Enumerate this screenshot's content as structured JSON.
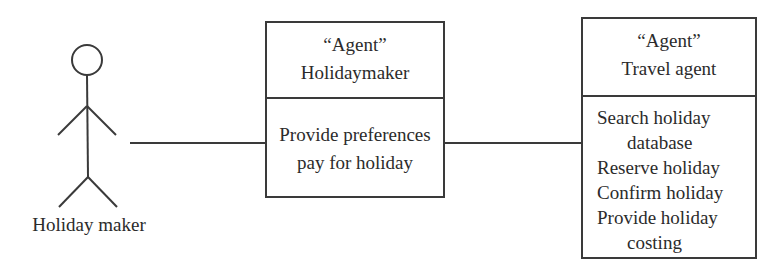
{
  "diagram": {
    "actor": {
      "label": "Holiday maker",
      "icon": "stick-figure-icon"
    },
    "agents": [
      {
        "stereotype": "“Agent”",
        "name": "Holidaymaker",
        "responsibilities": [
          "Provide preferences",
          "pay for holiday"
        ]
      },
      {
        "stereotype": "“Agent”",
        "name": "Travel agent",
        "responsibilities": [
          "Search holiday",
          "database",
          "Reserve holiday",
          "Confirm holiday",
          "Provide holiday",
          "costing"
        ]
      }
    ],
    "connections": [
      {
        "from": "Holiday maker",
        "to": "Holidaymaker"
      },
      {
        "from": "Holidaymaker",
        "to": "Travel agent"
      }
    ],
    "colors": {
      "line": "#3a3a3a",
      "text": "#2b2b2b",
      "background": "#ffffff"
    }
  }
}
